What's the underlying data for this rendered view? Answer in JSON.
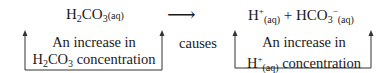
{
  "reaction": {
    "reactant": {
      "base": "H",
      "sub1": "2",
      "mid": "CO",
      "sub2": "3",
      "state": "(aq)"
    },
    "arrow": "⟶",
    "products": {
      "p1": {
        "base": "H",
        "charge": "+",
        "state": "(aq)"
      },
      "plus": "+",
      "p2": {
        "base": "HCO",
        "sub": "3",
        "charge": "−",
        "state": "(aq)"
      }
    }
  },
  "left_box": {
    "line1": "An increase in",
    "line2_base": "H",
    "line2_sub1": "2",
    "line2_mid": "CO",
    "line2_sub2": "3",
    "line2_rest": " concentration"
  },
  "connector": "causes",
  "right_box": {
    "line1": "An increase in",
    "line2_base": "H",
    "line2_charge": "+",
    "line2_state": "(aq)",
    "line2_rest": " concentration"
  },
  "colors": {
    "ink": "#1a1a1a",
    "background": "#ffffff"
  }
}
